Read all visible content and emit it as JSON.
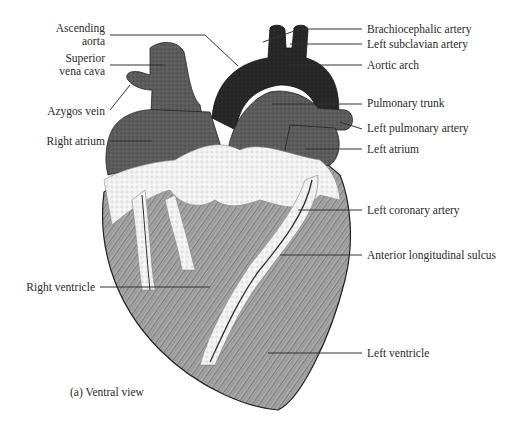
{
  "figure": {
    "caption": "(a) Ventral view",
    "view": "Ventral",
    "colors": {
      "vessel_dark": "#2b2b2b",
      "atrium_gray": "#5a5a5a",
      "ventricle_gray": "#9a9a9a",
      "fat_white": "#f4f4f4",
      "leader_line": "#333333"
    }
  },
  "labels_left": [
    {
      "id": "ascending-aorta",
      "line1": "Ascending",
      "line2": "aorta"
    },
    {
      "id": "superior-vena-cava",
      "line1": "Superior",
      "line2": "vena cava"
    },
    {
      "id": "azygos-vein",
      "line1": "Azygos vein"
    },
    {
      "id": "right-atrium",
      "line1": "Right atrium"
    },
    {
      "id": "right-ventricle",
      "line1": "Right ventricle"
    }
  ],
  "labels_right": [
    {
      "id": "brachiocephalic-artery",
      "text": "Brachiocephalic artery"
    },
    {
      "id": "left-subclavian-artery",
      "text": "Left subclavian artery"
    },
    {
      "id": "aortic-arch",
      "text": "Aortic arch"
    },
    {
      "id": "pulmonary-trunk",
      "text": "Pulmonary trunk"
    },
    {
      "id": "left-pulmonary-artery",
      "text": "Left pulmonary artery"
    },
    {
      "id": "left-atrium",
      "text": "Left atrium"
    },
    {
      "id": "left-coronary-artery",
      "text": "Left coronary artery"
    },
    {
      "id": "anterior-longitudinal-sulcus",
      "text": "Anterior longitudinal sulcus"
    },
    {
      "id": "left-ventricle",
      "text": "Left ventricle"
    }
  ]
}
